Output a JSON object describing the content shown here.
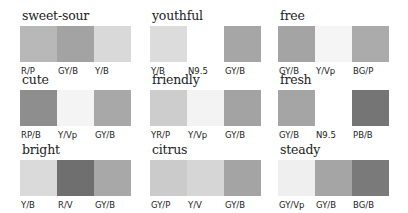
{
  "groups": [
    {
      "title": "sweet-sour",
      "swatches": [
        {
          "label": "R/P",
          "color": "#b8b8b8"
        },
        {
          "label": "GY/B",
          "color": "#a3a3a3"
        },
        {
          "label": "Y/B",
          "color": "#d9d9d9"
        }
      ]
    },
    {
      "title": "youthful",
      "swatches": [
        {
          "label": "Y/B",
          "color": "#dcdcdc"
        },
        {
          "label": "N9.5",
          "color": "#ffffff"
        },
        {
          "label": "GY/B",
          "color": "#a6a6a6"
        }
      ]
    },
    {
      "title": "free",
      "swatches": [
        {
          "label": "GY/B",
          "color": "#a4a4a4"
        },
        {
          "label": "Y/Vp",
          "color": "#f5f5f5"
        },
        {
          "label": "BG/P",
          "color": "#ababab"
        }
      ]
    },
    {
      "title": "cute",
      "swatches": [
        {
          "label": "RP/B",
          "color": "#8e8e8e"
        },
        {
          "label": "Y/Vp",
          "color": "#f4f4f4"
        },
        {
          "label": "GY/B",
          "color": "#a8a8a8"
        }
      ]
    },
    {
      "title": "friendly",
      "swatches": [
        {
          "label": "YR/P",
          "color": "#cdcdcd"
        },
        {
          "label": "Y/Vp",
          "color": "#f3f3f3"
        },
        {
          "label": "GY/B",
          "color": "#a3a3a3"
        }
      ]
    },
    {
      "title": "fresh",
      "swatches": [
        {
          "label": "GY/B",
          "color": "#a5a5a5"
        },
        {
          "label": "N9.5",
          "color": "#ffffff"
        },
        {
          "label": "PB/B",
          "color": "#757575"
        }
      ]
    },
    {
      "title": "bright",
      "swatches": [
        {
          "label": "Y/B",
          "color": "#dadada"
        },
        {
          "label": "R/V",
          "color": "#6f6f6f"
        },
        {
          "label": "GY/B",
          "color": "#a8a8a8"
        }
      ]
    },
    {
      "title": "citrus",
      "swatches": [
        {
          "label": "GY/P",
          "color": "#cbcbcb"
        },
        {
          "label": "Y/V",
          "color": "#d6d6d6"
        },
        {
          "label": "GY/B",
          "color": "#a4a4a4"
        }
      ]
    },
    {
      "title": "steady",
      "swatches": [
        {
          "label": "GY/Vp",
          "color": "#efefef"
        },
        {
          "label": "GY/B",
          "color": "#a5a5a5"
        },
        {
          "label": "BG/B",
          "color": "#7a7a7a"
        }
      ]
    }
  ]
}
